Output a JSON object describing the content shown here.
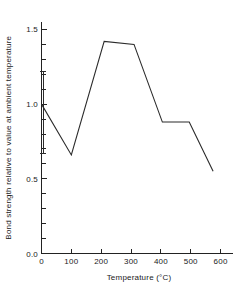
{
  "chart_data": {
    "type": "line",
    "title": "",
    "xlabel": "Temperature (°C)",
    "ylabel": "Bond strength relative to value at ambient temperature",
    "xlim": [
      0,
      640
    ],
    "ylim": [
      0.0,
      1.55
    ],
    "grid": false,
    "legend": null,
    "x_ticks": [
      0,
      100,
      200,
      300,
      400,
      500,
      600
    ],
    "x_tick_labels": [
      "0",
      "100",
      "200",
      "300",
      "400",
      "500",
      "600"
    ],
    "y_ticks": [
      0.0,
      0.5,
      1.0,
      1.5
    ],
    "y_tick_labels": [
      "0.0",
      "0.5",
      "1.0",
      "1.5"
    ],
    "y_minor_tick_step": 0.1,
    "x": [
      0,
      100,
      210,
      310,
      405,
      495,
      575
    ],
    "values": [
      1.0,
      0.66,
      1.42,
      1.4,
      0.88,
      0.88,
      0.55
    ],
    "error_bars": [
      {
        "x": 0,
        "y": 1.0,
        "low": 0.67,
        "high": 1.22
      }
    ],
    "line_color": "#2b2b2b",
    "axis_color": "#222222",
    "background_color": "#ffffff"
  },
  "axes": {
    "x_axis_name": "temperature-axis",
    "y_axis_name": "bond-strength-axis"
  }
}
